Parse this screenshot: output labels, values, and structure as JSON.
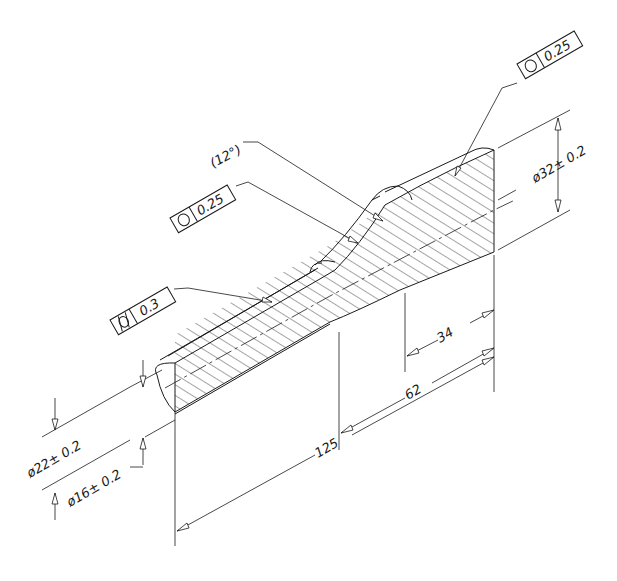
{
  "drawing": {
    "title": "Isometric section view of tapered shaft with GD&T callouts",
    "feature_control_frames": [
      {
        "id": "fcf-top-right",
        "symbol": "circularity",
        "symbol_glyph": "○",
        "tolerance": "0.25"
      },
      {
        "id": "fcf-middle",
        "symbol": "circularity",
        "symbol_glyph": "○",
        "tolerance": "0.25"
      },
      {
        "id": "fcf-left",
        "symbol": "cylindricity",
        "symbol_glyph": "⌭",
        "tolerance": "0.3"
      }
    ],
    "angle_reference": "(12°)",
    "dimensions": {
      "large_diameter": "ø32± 0.2",
      "outer_left_diameter": "ø22± 0.2",
      "inner_left_diameter": "ø16± 0.2",
      "taper_length": "34",
      "large_section_length": "62",
      "overall_length": "125"
    },
    "colors": {
      "line": "#1a1a1a",
      "background": "#ffffff"
    }
  }
}
